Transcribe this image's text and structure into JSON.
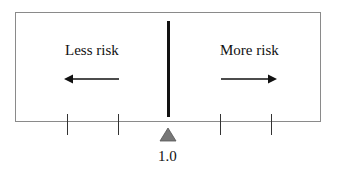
{
  "diagram": {
    "left_label": "Less risk",
    "right_label": "More risk",
    "left_arrow_icon": "arrow-left-icon",
    "right_arrow_icon": "arrow-right-icon",
    "marker_icon": "triangle-up-icon",
    "marker_label": "1.0",
    "tick_count": 4,
    "colors": {
      "box_border": "#8a8a8a",
      "divider": "#111111",
      "marker": "#777777",
      "text": "#111111"
    }
  }
}
